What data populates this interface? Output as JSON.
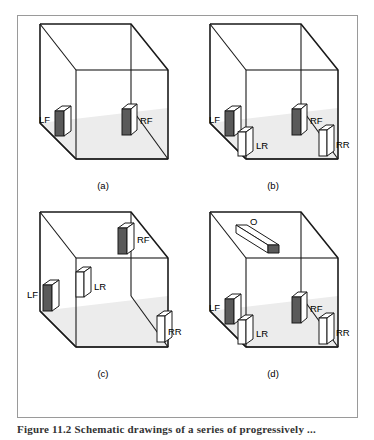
{
  "figure": {
    "caption": "Figure 11.2   Schematic drawings of a series of progressively ...",
    "frame_color": "#9a9a9a",
    "line_color": "#1a1a1a",
    "floor_fill": "#ececec",
    "speaker_dark_fill": "#5a5a5a",
    "speaker_light_fill": "#ffffff"
  },
  "panels": [
    {
      "id": "a",
      "label": "(a)",
      "speakers": [
        {
          "name": "LF",
          "label": "LF",
          "style": "dark",
          "position": "left-wall-front"
        },
        {
          "name": "RF",
          "label": "RF",
          "style": "dark",
          "position": "back-wall-right"
        }
      ]
    },
    {
      "id": "b",
      "label": "(b)",
      "speakers": [
        {
          "name": "LF",
          "label": "LF",
          "style": "dark",
          "position": "left-wall-front"
        },
        {
          "name": "RF",
          "label": "RF",
          "style": "dark",
          "position": "back-wall-right"
        },
        {
          "name": "LR",
          "label": "LR",
          "style": "light",
          "position": "floor-left-rear"
        },
        {
          "name": "RR",
          "label": "RR",
          "style": "light",
          "position": "floor-right-rear"
        }
      ]
    },
    {
      "id": "c",
      "label": "(c)",
      "speakers": [
        {
          "name": "LF",
          "label": "LF",
          "style": "dark",
          "position": "left-wall-mid"
        },
        {
          "name": "RF",
          "label": "RF",
          "style": "dark",
          "position": "back-wall-right-high"
        },
        {
          "name": "LR",
          "label": "LR",
          "style": "light",
          "position": "mid-left-elevated"
        },
        {
          "name": "RR",
          "label": "RR",
          "style": "light",
          "position": "right-wall-low"
        }
      ]
    },
    {
      "id": "d",
      "label": "(d)",
      "speakers": [
        {
          "name": "O",
          "label": "O",
          "style": "dark",
          "position": "ceiling-overhead"
        },
        {
          "name": "LF",
          "label": "LF",
          "style": "dark",
          "position": "left-wall-front"
        },
        {
          "name": "RF",
          "label": "RF",
          "style": "dark",
          "position": "back-wall-right"
        },
        {
          "name": "LR",
          "label": "LR",
          "style": "light",
          "position": "floor-left-rear"
        },
        {
          "name": "RR",
          "label": "RR",
          "style": "light",
          "position": "floor-right-rear"
        }
      ]
    }
  ]
}
